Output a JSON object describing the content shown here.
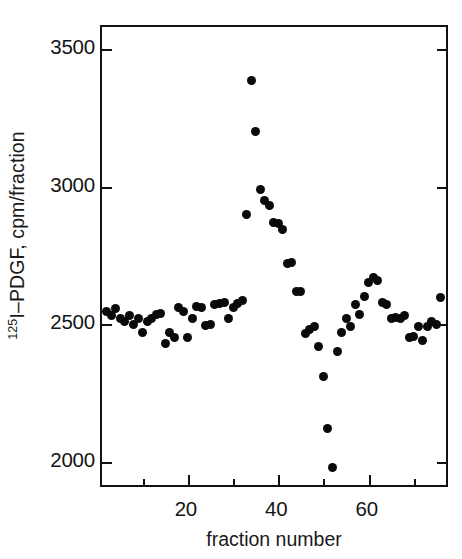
{
  "chart_data": {
    "type": "scatter",
    "title": "",
    "xlabel": "fraction number",
    "ylabel": "125I-PDGF, cpm/fraction",
    "ylabel_prefix_sup": "125",
    "ylabel_rest": "I–PDGF, cpm/fraction",
    "xlim": [
      1,
      78
    ],
    "ylim": [
      1900,
      3580
    ],
    "grid": false,
    "legend": null,
    "xticks_major": [
      20,
      40,
      60
    ],
    "xticks_major_labels": [
      "20",
      "40",
      "60"
    ],
    "xticks_minor": [
      10,
      30,
      50,
      70
    ],
    "yticks": [
      2000,
      2500,
      3000,
      3500
    ],
    "ytick_labels": [
      "2000",
      "2500",
      "3000",
      "3500"
    ],
    "marker": "filled-circle",
    "marker_color": "#0a0a0a",
    "series": [
      {
        "name": "125I-PDGF",
        "x": [
          2,
          3,
          4,
          5,
          6,
          7,
          8,
          9,
          10,
          11,
          12,
          13,
          14,
          15,
          16,
          17,
          18,
          19,
          20,
          21,
          22,
          23,
          24,
          25,
          26,
          27,
          28,
          29,
          30,
          31,
          32,
          33,
          34,
          35,
          36,
          37,
          38,
          39,
          40,
          41,
          42,
          43,
          44,
          45,
          46,
          47,
          48,
          49,
          50,
          51,
          52,
          53,
          54,
          55,
          56,
          57,
          58,
          59,
          60,
          61,
          62,
          63,
          64,
          65,
          66,
          67,
          68,
          69,
          70,
          71,
          72,
          73,
          74,
          75,
          76
        ],
        "y": [
          2545,
          2530,
          2555,
          2520,
          2510,
          2530,
          2500,
          2520,
          2470,
          2510,
          2520,
          2535,
          2540,
          2430,
          2470,
          2450,
          2560,
          2545,
          2450,
          2520,
          2565,
          2560,
          2495,
          2500,
          2570,
          2575,
          2580,
          2520,
          2560,
          2575,
          2585,
          2900,
          3385,
          3200,
          2990,
          2950,
          2930,
          2870,
          2865,
          2845,
          2720,
          2725,
          2620,
          2620,
          2465,
          2480,
          2490,
          2420,
          2310,
          2120,
          1980,
          2400,
          2470,
          2520,
          2490,
          2570,
          2535,
          2600,
          2650,
          2670,
          2660,
          2580,
          2570,
          2520,
          2525,
          2520,
          2530,
          2450,
          2455,
          2490,
          2440,
          2490,
          2510,
          2500,
          2595
        ]
      }
    ]
  }
}
